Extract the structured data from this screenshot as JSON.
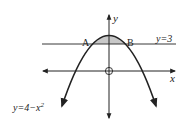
{
  "diagram": {
    "axes": {
      "x_label": "x",
      "y_label": "y",
      "origin_label": "O"
    },
    "curve": {
      "equation_label": "y=4−x",
      "equation_exponent": "2",
      "equation": "y = 4 - x^2",
      "vertex": [
        0,
        4
      ]
    },
    "line": {
      "label": "y=3",
      "equation": "y = 3"
    },
    "points": [
      {
        "name": "A",
        "x": -1,
        "y": 3
      },
      {
        "name": "B",
        "x": 1,
        "y": 3
      }
    ],
    "shaded_region": "region between parabola and y=3, from A to B",
    "colors": {
      "stroke": "#222222",
      "shade": "#c8c8c8",
      "background": "#ffffff"
    }
  }
}
